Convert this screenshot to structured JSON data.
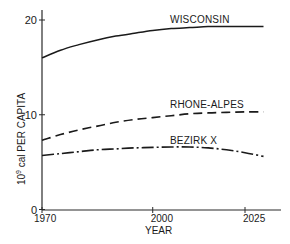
{
  "chart_data": {
    "type": "line",
    "title": "",
    "xlabel": "YEAR",
    "ylabel": "10^9 cal PER CAPITA",
    "ylabel_base": "10",
    "ylabel_exp": "9",
    "ylabel_rest": " cal PER CAPITA",
    "xlim": [
      1970,
      2032
    ],
    "ylim": [
      0,
      21
    ],
    "x_ticks": [
      1970,
      2000,
      2025
    ],
    "x_tick_labels": [
      "1970",
      "2000",
      "2025"
    ],
    "y_ticks": [
      0,
      10,
      20
    ],
    "y_tick_labels": [
      "0",
      "10",
      "20"
    ],
    "grid": false,
    "legend": "inline labels",
    "x": [
      1970,
      1975,
      1980,
      1985,
      1990,
      1995,
      2000,
      2005,
      2010,
      2015,
      2020,
      2025,
      2030
    ],
    "series": [
      {
        "name": "WISCONSIN",
        "style": "solid",
        "values": [
          16.0,
          16.8,
          17.4,
          17.9,
          18.3,
          18.6,
          18.9,
          19.1,
          19.2,
          19.3,
          19.3,
          19.3,
          19.3
        ]
      },
      {
        "name": "RHONE-ALPES",
        "style": "dashed",
        "values": [
          7.3,
          7.9,
          8.4,
          8.8,
          9.2,
          9.5,
          9.7,
          9.9,
          10.1,
          10.2,
          10.25,
          10.3,
          10.3
        ]
      },
      {
        "name": "BEZIRK X",
        "style": "dash-dot",
        "values": [
          5.7,
          5.9,
          6.1,
          6.3,
          6.4,
          6.5,
          6.55,
          6.6,
          6.6,
          6.5,
          6.3,
          6.0,
          5.6
        ]
      }
    ]
  }
}
